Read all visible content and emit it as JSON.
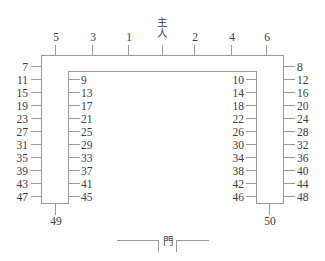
{
  "diagram": {
    "title_center": "主人",
    "title_center_chars": [
      "主",
      "人"
    ],
    "door_label": "門",
    "line_color": "#9a9a9a",
    "text_color": "#3d3d3d",
    "background": "#ffffff",
    "top_seats": [
      "5",
      "3",
      "1",
      "2",
      "4",
      "6"
    ],
    "left_outer_seats": [
      "7",
      "11",
      "15",
      "19",
      "23",
      "27",
      "31",
      "35",
      "39",
      "43",
      "47"
    ],
    "left_inner_seats": [
      "9",
      "13",
      "17",
      "21",
      "25",
      "29",
      "33",
      "37",
      "41",
      "45"
    ],
    "right_inner_seats": [
      "10",
      "14",
      "18",
      "22",
      "26",
      "30",
      "34",
      "38",
      "42",
      "46"
    ],
    "right_outer_seats": [
      "8",
      "12",
      "16",
      "20",
      "24",
      "28",
      "32",
      "36",
      "40",
      "44",
      "48"
    ],
    "bottom_left_seat": "49",
    "bottom_right_seat": "50"
  }
}
